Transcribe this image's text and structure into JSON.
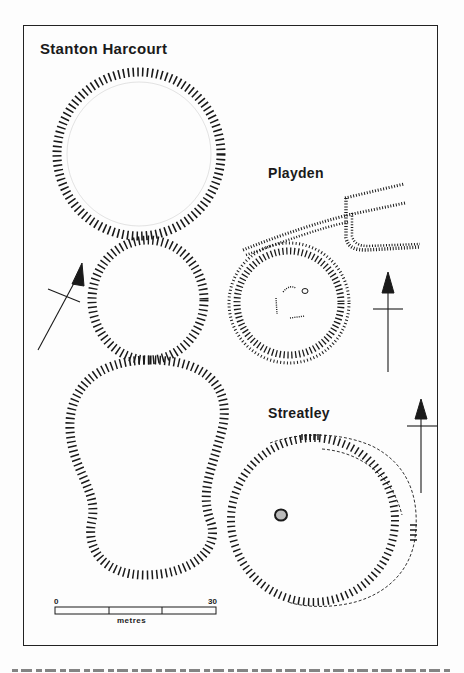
{
  "figure": {
    "sites": [
      {
        "name": "Stanton Harcourt"
      },
      {
        "name": "Playden"
      },
      {
        "name": "Streatley"
      }
    ],
    "scale_bar": {
      "start_label": "0",
      "end_label": "30",
      "unit_label": "metres",
      "segments": 3
    },
    "north_arrows": 3,
    "colors": {
      "ink": "#1a1a1a",
      "paper": "#fdfdfd"
    }
  }
}
